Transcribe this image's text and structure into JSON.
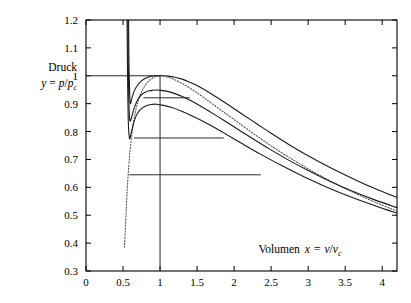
{
  "chart_data": {
    "type": "line",
    "title": "",
    "subtitle": "",
    "xlabel": "Volumen x = v/v_c",
    "xlabel_parts": {
      "word": "Volumen",
      "var": "x",
      "eq": "=",
      "num": "v",
      "den": "v",
      "den_sub": "c"
    },
    "ylabel": "Druck y = p/p_c",
    "ylabel_parts": {
      "word": "Druck",
      "var": "y",
      "eq": "=",
      "num": "p",
      "den": "p",
      "den_sub": "c"
    },
    "xlim": [
      0,
      4.2
    ],
    "ylim": [
      0.3,
      1.2
    ],
    "xticks": [
      0,
      0.5,
      1,
      1.5,
      2,
      2.5,
      3,
      3.5,
      4
    ],
    "xtick_labels": [
      "0",
      "0.5",
      "1",
      "1.5",
      "2",
      "2.5",
      "3",
      "3.5",
      "4"
    ],
    "yticks": [
      0.3,
      0.4,
      0.5,
      0.6,
      0.7,
      0.8,
      0.9,
      1,
      1.1,
      1.2
    ],
    "ytick_labels": [
      "0.3",
      "0.4",
      "0.5",
      "0.6",
      "0.7",
      "0.8",
      "0.9",
      "1",
      "1.1",
      "1.2"
    ],
    "grid": false,
    "legend": "none",
    "critical_point": [
      1,
      1
    ],
    "series": [
      {
        "name": "isotherm-critical",
        "style": "solid",
        "t_reduced": 1.0,
        "points": [
          [
            0.575,
            1.2
          ],
          [
            0.58,
            1.05
          ],
          [
            0.59,
            0.93
          ],
          [
            0.6,
            0.9
          ],
          [
            0.62,
            0.92
          ],
          [
            0.65,
            0.945
          ],
          [
            0.7,
            0.968
          ],
          [
            0.75,
            0.982
          ],
          [
            0.8,
            0.991
          ],
          [
            0.85,
            0.996
          ],
          [
            0.9,
            0.999
          ],
          [
            0.95,
            1.0
          ],
          [
            1.0,
            1.0
          ],
          [
            1.05,
            1.0
          ],
          [
            1.1,
            0.999
          ],
          [
            1.2,
            0.995
          ],
          [
            1.3,
            0.988
          ],
          [
            1.4,
            0.977
          ],
          [
            1.5,
            0.965
          ],
          [
            1.7,
            0.934
          ],
          [
            1.9,
            0.9
          ],
          [
            2.1,
            0.864
          ],
          [
            2.3,
            0.829
          ],
          [
            2.5,
            0.794
          ],
          [
            2.75,
            0.752
          ],
          [
            3.0,
            0.713
          ],
          [
            3.25,
            0.677
          ],
          [
            3.5,
            0.644
          ],
          [
            3.75,
            0.613
          ],
          [
            4.0,
            0.585
          ],
          [
            4.2,
            0.564
          ]
        ]
      },
      {
        "name": "isotherm-sub-1",
        "style": "solid",
        "t_reduced": 0.985,
        "points": [
          [
            0.565,
            1.2
          ],
          [
            0.572,
            1.02
          ],
          [
            0.582,
            0.88
          ],
          [
            0.595,
            0.838
          ],
          [
            0.62,
            0.855
          ],
          [
            0.65,
            0.884
          ],
          [
            0.7,
            0.915
          ],
          [
            0.75,
            0.932
          ],
          [
            0.8,
            0.941
          ],
          [
            0.85,
            0.946
          ],
          [
            0.9,
            0.948
          ],
          [
            0.95,
            0.949
          ],
          [
            1.0,
            0.948
          ],
          [
            1.1,
            0.944
          ],
          [
            1.2,
            0.936
          ],
          [
            1.3,
            0.926
          ],
          [
            1.4,
            0.913
          ],
          [
            1.55,
            0.891
          ],
          [
            1.75,
            0.859
          ],
          [
            1.95,
            0.825
          ],
          [
            2.2,
            0.783
          ],
          [
            2.45,
            0.742
          ],
          [
            2.7,
            0.703
          ],
          [
            3.0,
            0.66
          ],
          [
            3.3,
            0.621
          ],
          [
            3.6,
            0.586
          ],
          [
            3.9,
            0.555
          ],
          [
            4.2,
            0.527
          ]
        ]
      },
      {
        "name": "isotherm-sub-2",
        "style": "solid",
        "t_reduced": 0.965,
        "points": [
          [
            0.555,
            1.2
          ],
          [
            0.562,
            0.99
          ],
          [
            0.572,
            0.83
          ],
          [
            0.588,
            0.775
          ],
          [
            0.61,
            0.795
          ],
          [
            0.64,
            0.828
          ],
          [
            0.68,
            0.858
          ],
          [
            0.73,
            0.878
          ],
          [
            0.8,
            0.891
          ],
          [
            0.88,
            0.897
          ],
          [
            0.95,
            0.898
          ],
          [
            1.05,
            0.894
          ],
          [
            1.15,
            0.887
          ],
          [
            1.3,
            0.872
          ],
          [
            1.45,
            0.854
          ],
          [
            1.65,
            0.827
          ],
          [
            1.85,
            0.797
          ],
          [
            2.1,
            0.758
          ],
          [
            2.35,
            0.72
          ],
          [
            2.65,
            0.677
          ],
          [
            2.95,
            0.637
          ],
          [
            3.3,
            0.595
          ],
          [
            3.65,
            0.558
          ],
          [
            4.0,
            0.525
          ],
          [
            4.2,
            0.507
          ]
        ]
      }
    ],
    "binodal": {
      "name": "coexistence-curve-binodal",
      "style": "dotted",
      "points": [
        [
          0.52,
          0.385
        ],
        [
          0.535,
          0.47
        ],
        [
          0.548,
          0.545
        ],
        [
          0.562,
          0.615
        ],
        [
          0.578,
          0.678
        ],
        [
          0.596,
          0.735
        ],
        [
          0.618,
          0.787
        ],
        [
          0.645,
          0.838
        ],
        [
          0.675,
          0.88
        ],
        [
          0.71,
          0.914
        ],
        [
          0.75,
          0.942
        ],
        [
          0.8,
          0.966
        ],
        [
          0.86,
          0.984
        ],
        [
          0.93,
          0.996
        ],
        [
          1.0,
          1.0
        ],
        [
          1.08,
          0.997
        ],
        [
          1.17,
          0.989
        ],
        [
          1.28,
          0.975
        ],
        [
          1.42,
          0.953
        ],
        [
          1.58,
          0.924
        ],
        [
          1.78,
          0.885
        ],
        [
          2.0,
          0.843
        ],
        [
          2.25,
          0.795
        ],
        [
          2.5,
          0.749
        ],
        [
          2.8,
          0.698
        ],
        [
          3.1,
          0.651
        ],
        [
          3.4,
          0.609
        ],
        [
          3.7,
          0.571
        ],
        [
          4.0,
          0.536
        ],
        [
          4.2,
          0.515
        ]
      ],
      "note": "rendered below the right branch as the lowest dotted trace"
    },
    "tie_lines": [
      {
        "name": "tie-line-critical",
        "y": 1.0,
        "x_start": 0.0,
        "x_end": 1.0
      },
      {
        "name": "tie-line-1",
        "y": 0.921,
        "x_start": 0.775,
        "x_end": 1.4
      },
      {
        "name": "tie-line-2",
        "y": 0.777,
        "x_start": 0.648,
        "x_end": 1.86
      },
      {
        "name": "tie-line-3",
        "y": 0.645,
        "x_start": 0.585,
        "x_end": 2.36
      }
    ],
    "vertical_lines": [
      {
        "name": "critical-volume-line",
        "x": 1.0,
        "y_start": 0.3,
        "y_end": 1.0
      }
    ]
  }
}
